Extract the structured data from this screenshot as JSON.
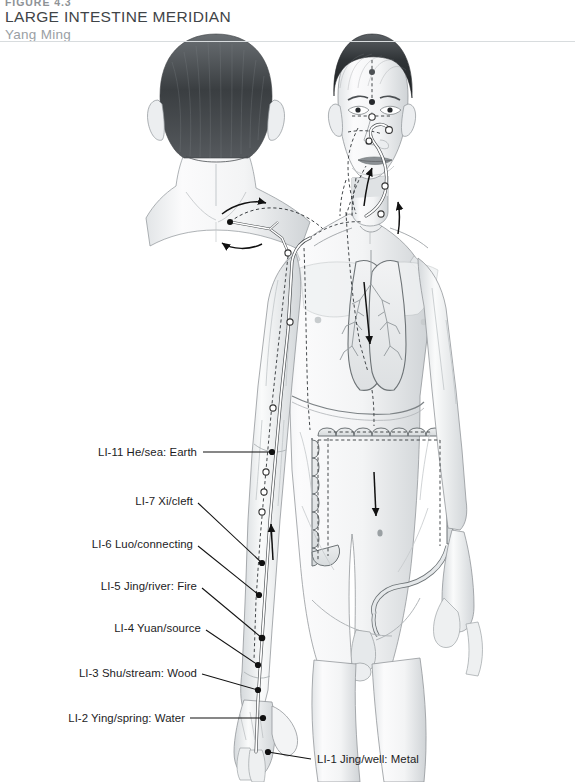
{
  "figure": {
    "number": "FIGURE 4.3",
    "title": "LARGE INTESTINE MERIDIAN",
    "subtitle": "Yang Ming"
  },
  "colors": {
    "title": "#3f4447",
    "subtitle": "#9aa0a4",
    "label": "#1c1c1e",
    "rule": "#d8dcde",
    "meridian_line": "#ffffff",
    "meridian_outline": "#4a4a4a",
    "point_fill": "#ffffff",
    "point_stroke": "#333333",
    "marker_solid": "#111111",
    "organ_line": "#6d7376",
    "skin_light": "#f7f8f8",
    "skin_shade": "#d9dcde",
    "hair_dark": "#2e3134"
  },
  "labels": [
    {
      "id": "li-11",
      "text": "LI-11 He/sea: Earth",
      "x": 197,
      "y": 452,
      "align": "right",
      "leader": {
        "x1": 203,
        "y1": 452,
        "x2": 272,
        "y2": 452
      }
    },
    {
      "id": "li-7",
      "text": "LI-7 Xi/cleft",
      "x": 193,
      "y": 501,
      "align": "right",
      "leader": {
        "x1": 198,
        "y1": 503,
        "x2": 262,
        "y2": 563
      }
    },
    {
      "id": "li-6",
      "text": "LI-6 Luo/connecting",
      "x": 193,
      "y": 544,
      "align": "right",
      "leader": {
        "x1": 198,
        "y1": 546,
        "x2": 259,
        "y2": 595
      }
    },
    {
      "id": "li-5",
      "text": "LI-5 Jing/river: Fire",
      "x": 197,
      "y": 586,
      "align": "right",
      "leader": {
        "x1": 202,
        "y1": 588,
        "x2": 262,
        "y2": 638
      }
    },
    {
      "id": "li-4",
      "text": "LI-4 Yuan/source",
      "x": 201,
      "y": 628,
      "align": "right",
      "leader": {
        "x1": 206,
        "y1": 630,
        "x2": 258,
        "y2": 665
      }
    },
    {
      "id": "li-3",
      "text": "LI-3 Shu/stream: Wood",
      "x": 197,
      "y": 673,
      "align": "right",
      "leader": {
        "x1": 202,
        "y1": 674,
        "x2": 258,
        "y2": 690
      }
    },
    {
      "id": "li-2",
      "text": "LI-2 Ying/spring: Water",
      "x": 185,
      "y": 718,
      "align": "right",
      "leader": {
        "x1": 190,
        "y1": 718,
        "x2": 263,
        "y2": 718
      }
    },
    {
      "id": "li-1",
      "text": "LI-1 Jing/well: Metal",
      "x": 317,
      "y": 759,
      "align": "left",
      "leader": {
        "x1": 311,
        "y1": 759,
        "x2": 268,
        "y2": 752
      }
    }
  ],
  "figures": {
    "main": {
      "name": "male-anterior-body",
      "view": "front"
    },
    "inset": {
      "name": "head-posterior-view",
      "view": "back"
    }
  },
  "organs": [
    {
      "name": "lung-left"
    },
    {
      "name": "lung-right"
    },
    {
      "name": "bronchial-tree"
    },
    {
      "name": "diaphragm"
    },
    {
      "name": "large-intestine-colon"
    }
  ],
  "meridian": {
    "name": "large-intestine-meridian",
    "surface_style": "solid-white-outlined",
    "internal_style": "dashed",
    "flow_arrows": 6
  }
}
